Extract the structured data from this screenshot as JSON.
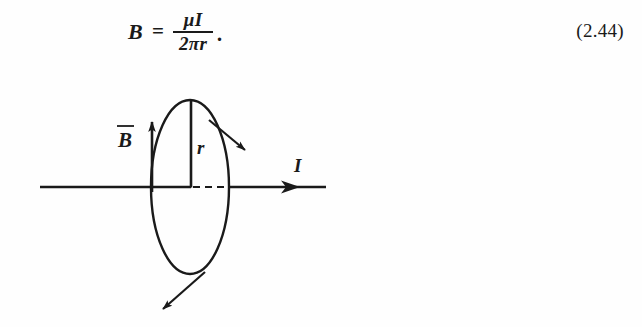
{
  "page": {
    "background_color": "#fefefe",
    "ink_color": "#1a1a1a"
  },
  "equation": {
    "lhs": "B",
    "equals": "=",
    "numerator": "μI",
    "denominator": "2πr",
    "trailing_punctuation": "·",
    "number": "(2.44)",
    "plain_text": "B = μI / 2πr ."
  },
  "figure": {
    "caption": "",
    "labels": {
      "b_field": "B",
      "b_field_overbar": true,
      "radius": "r",
      "current": "I"
    },
    "elements": {
      "wire_label": "I",
      "wire_description": "horizontal current-carrying wire with rightward arrowhead",
      "loop_description": "vertical ellipse representing circular magnetic field line around the wire",
      "radius_description": "vertical line from wire to top of ellipse labelled r",
      "b_arrow_description": "upward arrow tangent to the field circle labelled B with overbar",
      "tangent_arrow_upper": "arrow tangent to the circle pointing down-right",
      "tangent_arrow_lower": "arrow tangent to the circle pointing down-left",
      "dashed_segment": "dashed portion of the wire hidden behind the field loop"
    }
  }
}
